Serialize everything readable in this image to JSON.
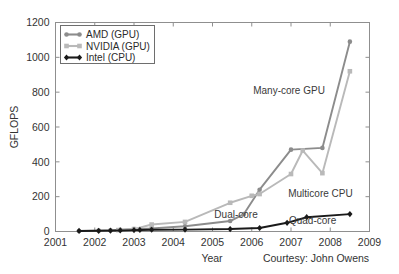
{
  "chart_data": {
    "type": "line",
    "title": "",
    "xlabel": "Year",
    "ylabel": "GFLOPS",
    "xlim": [
      2001,
      2009
    ],
    "ylim": [
      0,
      1200
    ],
    "xticks": [
      "2001",
      "2002",
      "2003",
      "2004",
      "2005",
      "2006",
      "2007",
      "2008",
      "2009"
    ],
    "yticks": [
      "0",
      "200",
      "400",
      "600",
      "800",
      "1000",
      "1200"
    ],
    "grid": false,
    "legend_position": "upper left",
    "series": [
      {
        "name": "AMD (GPU)",
        "color": "#8c8c8c",
        "marker": "circle",
        "x": [
          2001.6,
          2002.1,
          2002.4,
          2002.65,
          2003.0,
          2003.45,
          2004.3,
          2005.45,
          2005.8,
          2006.2,
          2007.0,
          2007.8,
          2008.5
        ],
        "y": [
          3,
          5,
          7,
          10,
          14,
          18,
          30,
          60,
          100,
          240,
          470,
          480,
          1090
        ]
      },
      {
        "name": "NVIDIA (GPU)",
        "color": "#b9b9b9",
        "marker": "square",
        "x": [
          2002.6,
          2003.0,
          2003.45,
          2004.3,
          2005.45,
          2006.0,
          2006.2,
          2007.0,
          2007.3,
          2007.8,
          2008.5
        ],
        "y": [
          8,
          14,
          40,
          55,
          165,
          205,
          215,
          330,
          465,
          335,
          920
        ]
      },
      {
        "name": "Intel (CPU)",
        "color": "#1a1a1a",
        "marker": "diamond",
        "x": [
          2001.6,
          2002.1,
          2002.4,
          2002.65,
          2003.0,
          2003.15,
          2003.45,
          2004.3,
          2005.45,
          2006.2,
          2006.9,
          2007.4,
          2008.5
        ],
        "y": [
          3,
          4,
          5,
          6,
          8,
          9,
          10,
          11,
          14,
          20,
          50,
          82,
          100
        ]
      }
    ],
    "annotations": [
      {
        "text": "Many-core GPU",
        "x": 2006.95,
        "y": 790
      },
      {
        "text": "Multicore CPU",
        "x": 2007.75,
        "y": 200
      },
      {
        "text": "Dual-core",
        "x": 2005.6,
        "y": 75
      },
      {
        "text": "Quad-core",
        "x": 2007.55,
        "y": 42
      }
    ],
    "credit": "Courtesy: John Owens"
  },
  "legend": {
    "items": [
      {
        "label": "AMD (GPU)"
      },
      {
        "label": "NVIDIA (GPU)"
      },
      {
        "label": "Intel (CPU)"
      }
    ]
  }
}
